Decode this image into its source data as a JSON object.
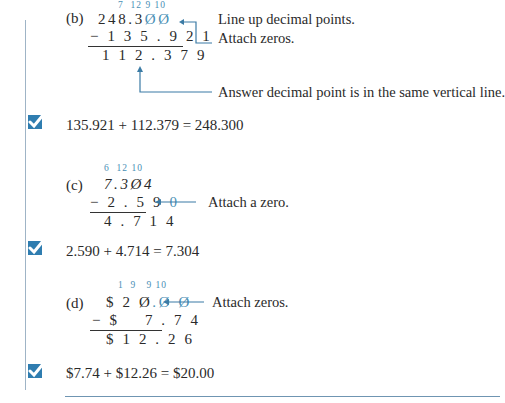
{
  "examples": [
    {
      "label": "(b)",
      "borrows": "7  12 9 10",
      "top_prefix": "248.",
      "top_struck": "3",
      "top_zeros": "ØØ",
      "top_display": "248.3ØØ",
      "subtrahend": "− 1 3 5 . 9 2 1",
      "answer": "1 1 2 . 3 7 9",
      "notes": [
        "Line up decimal points.",
        "Attach zeros.",
        "Answer decimal point is in the same vertical line."
      ],
      "check": "135.921 + 112.379 = 248.300"
    },
    {
      "label": "(c)",
      "borrows": "6  12 10",
      "top_display": "7.3Ø4",
      "subtrahend_prefix": "− 2 . 5 9 ",
      "subtrahend_added": "0",
      "answer": "4 . 7 1 4",
      "notes": [
        "Attach a zero."
      ],
      "check": "2.590 + 4.714 = 7.304"
    },
    {
      "label": "(d)",
      "borrows": "1  9   9 10",
      "top_prefix": "$ 2 Ø",
      "top_zeros": ".Ø Ø",
      "subtrahend": "− $    7 . 7 4",
      "answer": "$ 1 2 . 2 6",
      "notes": [
        "Attach zeros."
      ],
      "check": "$7.74 + $12.26 = $20.00"
    }
  ],
  "colors": {
    "accent": "#4a8fb5",
    "check_box": "#2f7db0",
    "rule": "#6f95b2"
  },
  "icons": [
    "checkmark-icon",
    "arrow-left-icon",
    "arrow-up-icon"
  ]
}
